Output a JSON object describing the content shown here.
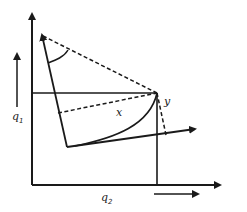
{
  "diagram": {
    "type": "coordinate-rotation",
    "labels": {
      "q1": "q",
      "q1_sub": "1",
      "q2": "q",
      "q2_sub": "2",
      "x": "x",
      "y": "y"
    },
    "colors": {
      "line": "#1a1a1a",
      "background": "#ffffff"
    }
  }
}
